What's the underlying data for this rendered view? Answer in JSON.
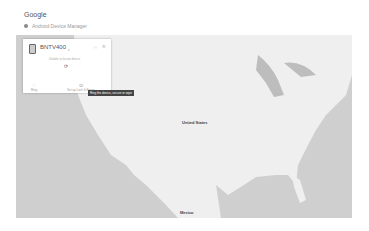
{
  "header": {
    "brand": "Google",
    "subtitle": "Android Device Manager",
    "subtitle_icon": "location-pin-icon"
  },
  "device_panel": {
    "device_name": "BNTV400",
    "device_icon": "tablet-icon",
    "status_text": "Unable to locate device",
    "refresh_icon": "refresh-icon",
    "actions": [
      {
        "label": "Ring",
        "icon": "ring-icon"
      },
      {
        "label": "Set up Lock & Erase",
        "icon": "lock-icon"
      }
    ],
    "tooltip": "Ring the device, secure or wipe"
  },
  "map": {
    "labels": {
      "country_us": "United States",
      "country_mx": "Mexico"
    },
    "colors": {
      "land": "#efefef",
      "water": "#c9c9c9"
    }
  }
}
